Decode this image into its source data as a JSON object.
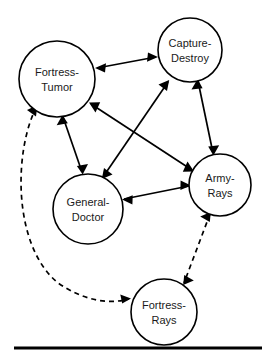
{
  "diagram": {
    "background_color": "#ffffff",
    "stroke_color": "#000000",
    "label_color": "#1a1a1a",
    "nodes": [
      {
        "id": "fortress-tumor",
        "label_line1": "Fortress-",
        "label_line2": "Tumor",
        "cx": 57,
        "cy": 79,
        "r": 38
      },
      {
        "id": "capture-destroy",
        "label_line1": "Capture-",
        "label_line2": "Destroy",
        "cx": 190,
        "cy": 50,
        "r": 32
      },
      {
        "id": "general-doctor",
        "label_line1": "General-",
        "label_line2": "Doctor",
        "cx": 88,
        "cy": 209,
        "r": 35
      },
      {
        "id": "army-rays",
        "label_line1": "Army-",
        "label_line2": "Rays",
        "cx": 220,
        "cy": 185,
        "r": 31
      },
      {
        "id": "fortress-rays",
        "label_line1": "Fortress-",
        "label_line2": "Rays",
        "cx": 164,
        "cy": 312,
        "r": 33
      }
    ],
    "edges": [
      {
        "id": "fortress-tumor--capture-destroy",
        "from": "fortress-tumor",
        "to": "capture-destroy",
        "style": "solid",
        "direction": "bidirectional"
      },
      {
        "id": "fortress-tumor--general-doctor",
        "from": "fortress-tumor",
        "to": "general-doctor",
        "style": "solid",
        "direction": "bidirectional"
      },
      {
        "id": "fortress-tumor--army-rays",
        "from": "fortress-tumor",
        "to": "army-rays",
        "style": "solid",
        "direction": "bidirectional"
      },
      {
        "id": "general-doctor--capture-destroy",
        "from": "general-doctor",
        "to": "capture-destroy",
        "style": "solid",
        "direction": "bidirectional"
      },
      {
        "id": "general-doctor--army-rays",
        "from": "general-doctor",
        "to": "army-rays",
        "style": "solid",
        "direction": "bidirectional"
      },
      {
        "id": "capture-destroy--army-rays",
        "from": "capture-destroy",
        "to": "army-rays",
        "style": "solid",
        "direction": "bidirectional"
      },
      {
        "id": "army-rays--fortress-rays",
        "from": "army-rays",
        "to": "fortress-rays",
        "style": "dashed",
        "direction": "bidirectional"
      },
      {
        "id": "fortress-tumor--fortress-rays",
        "from": "fortress-tumor",
        "to": "fortress-rays",
        "style": "dashed",
        "direction": "bidirectional",
        "curved": true
      }
    ],
    "rule": {
      "x1": 14,
      "x2": 262,
      "y": 348
    }
  }
}
